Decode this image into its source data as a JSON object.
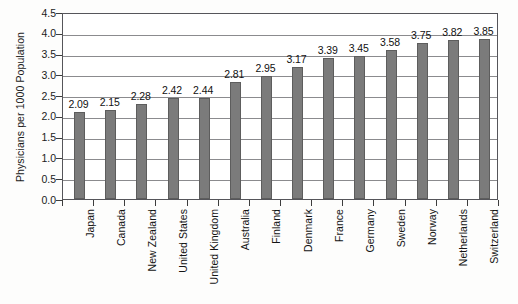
{
  "chart_data": {
    "type": "bar",
    "title": "",
    "xlabel": "",
    "ylabel": "Physicians per 1000 Population",
    "ylim": [
      0,
      4.5
    ],
    "ytick_step": 0.5,
    "yticks": [
      "4.5",
      "4.0",
      "3.5",
      "3.0",
      "2.5",
      "2.0",
      "1.5",
      "1.0",
      "0.5",
      "0.0"
    ],
    "grid": true,
    "legend": "none",
    "orientation": "vertical",
    "bar_color": "#7b7b7b",
    "bar_border_color": "#5d5d5d",
    "gridline_color": "#8b8b8e",
    "axis_color": "#55555a",
    "background_color": "#fdfdfc",
    "categories": [
      "Japan",
      "Canada",
      "New Zealand",
      "United States",
      "United Kingdom",
      "Australia",
      "Finland",
      "Denmark",
      "France",
      "Germany",
      "Sweden",
      "Norway",
      "Netherlands",
      "Switzerland"
    ],
    "values": [
      2.09,
      2.15,
      2.28,
      2.42,
      2.44,
      2.81,
      2.95,
      3.17,
      3.39,
      3.45,
      3.58,
      3.75,
      3.82,
      3.85
    ],
    "value_labels": [
      "2.09",
      "2.15",
      "2.28",
      "2.42",
      "2.44",
      "2.81",
      "2.95",
      "3.17",
      "3.39",
      "3.45",
      "3.58",
      "3.75",
      "3.82",
      "3.85"
    ]
  }
}
